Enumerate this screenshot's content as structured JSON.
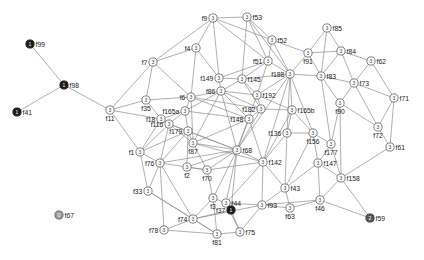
{
  "figure": {
    "type": "network-graph",
    "title": "",
    "background_color": "#ffffff",
    "edge_color": "#8c8c8c",
    "node_fill_default": "#ffffff",
    "node_stroke_default": "#6f6f6f",
    "label_color": "#1a1a1a"
  },
  "chart_data": {
    "type": "scatter",
    "title": "",
    "xlabel": "",
    "ylabel": "",
    "grid": false,
    "legend": "none",
    "node_state_legend": {
      "0": "gray node, value 0",
      "1": "black node, value 1",
      "2": "dark gray node, value 2",
      "3": "white node, value 3"
    },
    "nodes": [
      {
        "id": "f99",
        "label": "f99",
        "x": 30,
        "y": 44,
        "state": "1",
        "style": "dark",
        "lpos": "r"
      },
      {
        "id": "f98",
        "label": "f98",
        "x": 64,
        "y": 85,
        "state": "1",
        "style": "dark",
        "lpos": "r"
      },
      {
        "id": "f41",
        "label": "f41",
        "x": 17,
        "y": 112,
        "state": "1",
        "style": "dark",
        "lpos": "r"
      },
      {
        "id": "f67",
        "label": "f67",
        "x": 59,
        "y": 215,
        "state": "0",
        "style": "gray",
        "lpos": "r"
      },
      {
        "id": "f59",
        "label": "f59",
        "x": 370,
        "y": 218,
        "state": "2",
        "style": "mid",
        "lpos": "r"
      },
      {
        "id": "f11",
        "label": "f11",
        "x": 110,
        "y": 110,
        "state": "3",
        "style": "white",
        "lpos": "b"
      },
      {
        "id": "f35",
        "label": "f35",
        "x": 146,
        "y": 100,
        "state": "3",
        "style": "white",
        "lpos": "b"
      },
      {
        "id": "f7",
        "label": "f7",
        "x": 153,
        "y": 62,
        "state": "3",
        "style": "white",
        "lpos": "l"
      },
      {
        "id": "f4",
        "label": "f4",
        "x": 196,
        "y": 48,
        "state": "3",
        "style": "white",
        "lpos": "l"
      },
      {
        "id": "f18",
        "label": "f18",
        "x": 161,
        "y": 119,
        "state": "3",
        "style": "white",
        "lpos": "l"
      },
      {
        "id": "f6",
        "label": "f6",
        "x": 191,
        "y": 97,
        "state": "3",
        "style": "white",
        "lpos": "l"
      },
      {
        "id": "f165a",
        "label": "f165a",
        "x": 185,
        "y": 111,
        "state": "3",
        "style": "white",
        "lpos": "l"
      },
      {
        "id": "f86",
        "label": "f86",
        "x": 221,
        "y": 91,
        "state": "3",
        "style": "white",
        "lpos": "l"
      },
      {
        "id": "f149",
        "label": "f149",
        "x": 219,
        "y": 78,
        "state": "3",
        "style": "white",
        "lpos": "l"
      },
      {
        "id": "f9",
        "label": "f9",
        "x": 213,
        "y": 18,
        "state": "3",
        "style": "white",
        "lpos": "l"
      },
      {
        "id": "f53",
        "label": "f53",
        "x": 247,
        "y": 17,
        "state": "3",
        "style": "white",
        "lpos": "r"
      },
      {
        "id": "f52",
        "label": "f52",
        "x": 272,
        "y": 40,
        "state": "3",
        "style": "white",
        "lpos": "r"
      },
      {
        "id": "f51",
        "label": "f51",
        "x": 268,
        "y": 61,
        "state": "3",
        "style": "white",
        "lpos": "l"
      },
      {
        "id": "f145",
        "label": "f145",
        "x": 242,
        "y": 79,
        "state": "3",
        "style": "white",
        "lpos": "r"
      },
      {
        "id": "f192",
        "label": "f192",
        "x": 257,
        "y": 95,
        "state": "3",
        "style": "white",
        "lpos": "r"
      },
      {
        "id": "f182",
        "label": "f182",
        "x": 261,
        "y": 109,
        "state": "3",
        "style": "white",
        "lpos": "l"
      },
      {
        "id": "f148",
        "label": "f148",
        "x": 249,
        "y": 119,
        "state": "3",
        "style": "white",
        "lpos": "l"
      },
      {
        "id": "f188",
        "label": "f188",
        "x": 290,
        "y": 74,
        "state": "3",
        "style": "white",
        "lpos": "l"
      },
      {
        "id": "f91",
        "label": "f91",
        "x": 308,
        "y": 53,
        "state": "3",
        "style": "white",
        "lpos": "b"
      },
      {
        "id": "f85",
        "label": "f85",
        "x": 327,
        "y": 28,
        "state": "3",
        "style": "white",
        "lpos": "r"
      },
      {
        "id": "f84",
        "label": "f84",
        "x": 341,
        "y": 51,
        "state": "3",
        "style": "white",
        "lpos": "r"
      },
      {
        "id": "f83",
        "label": "f83",
        "x": 321,
        "y": 76,
        "state": "3",
        "style": "white",
        "lpos": "r"
      },
      {
        "id": "f62",
        "label": "f62",
        "x": 371,
        "y": 61,
        "state": "3",
        "style": "white",
        "lpos": "r"
      },
      {
        "id": "f73",
        "label": "f73",
        "x": 354,
        "y": 83,
        "state": "3",
        "style": "white",
        "lpos": "r"
      },
      {
        "id": "f71",
        "label": "f71",
        "x": 394,
        "y": 98,
        "state": "3",
        "style": "white",
        "lpos": "r"
      },
      {
        "id": "f90",
        "label": "f90",
        "x": 340,
        "y": 103,
        "state": "3",
        "style": "white",
        "lpos": "b"
      },
      {
        "id": "f72",
        "label": "f72",
        "x": 378,
        "y": 127,
        "state": "3",
        "style": "white",
        "lpos": "b"
      },
      {
        "id": "f61",
        "label": "f61",
        "x": 390,
        "y": 147,
        "state": "3",
        "style": "white",
        "lpos": "r"
      },
      {
        "id": "f165b",
        "label": "f165b",
        "x": 292,
        "y": 110,
        "state": "3",
        "style": "white",
        "lpos": "r"
      },
      {
        "id": "f136",
        "label": "f136",
        "x": 287,
        "y": 133,
        "state": "3",
        "style": "white",
        "lpos": "l"
      },
      {
        "id": "f156",
        "label": "f156",
        "x": 313,
        "y": 133,
        "state": "3",
        "style": "white",
        "lpos": "b"
      },
      {
        "id": "f177",
        "label": "f177",
        "x": 331,
        "y": 144,
        "state": "3",
        "style": "white",
        "lpos": "b"
      },
      {
        "id": "f147",
        "label": "f147",
        "x": 318,
        "y": 163,
        "state": "3",
        "style": "white",
        "lpos": "r"
      },
      {
        "id": "f158",
        "label": "f158",
        "x": 341,
        "y": 178,
        "state": "3",
        "style": "white",
        "lpos": "r"
      },
      {
        "id": "f46",
        "label": "f46",
        "x": 320,
        "y": 200,
        "state": "3",
        "style": "white",
        "lpos": "b"
      },
      {
        "id": "f43",
        "label": "f43",
        "x": 285,
        "y": 188,
        "state": "3",
        "style": "white",
        "lpos": "r"
      },
      {
        "id": "f63",
        "label": "f63",
        "x": 290,
        "y": 208,
        "state": "3",
        "style": "white",
        "lpos": "b"
      },
      {
        "id": "f93",
        "label": "f93",
        "x": 262,
        "y": 205,
        "state": "3",
        "style": "white",
        "lpos": "r"
      },
      {
        "id": "f75",
        "label": "f75",
        "x": 240,
        "y": 232,
        "state": "3",
        "style": "white",
        "lpos": "r"
      },
      {
        "id": "f44",
        "label": "f44",
        "x": 226,
        "y": 203,
        "state": "3",
        "style": "white",
        "lpos": "r"
      },
      {
        "id": "f37",
        "label": "f37",
        "x": 231,
        "y": 210,
        "state": "1",
        "style": "dark",
        "lpos": "l"
      },
      {
        "id": "f3",
        "label": "f3",
        "x": 213,
        "y": 198,
        "state": "3",
        "style": "white",
        "lpos": "b"
      },
      {
        "id": "f142",
        "label": "f142",
        "x": 263,
        "y": 162,
        "state": "3",
        "style": "white",
        "lpos": "r"
      },
      {
        "id": "f68",
        "label": "f68",
        "x": 237,
        "y": 150,
        "state": "3",
        "style": "white",
        "lpos": "r"
      },
      {
        "id": "f87",
        "label": "f87",
        "x": 193,
        "y": 143,
        "state": "3",
        "style": "white",
        "lpos": "b"
      },
      {
        "id": "f70",
        "label": "f70",
        "x": 207,
        "y": 170,
        "state": "3",
        "style": "white",
        "lpos": "b"
      },
      {
        "id": "f2",
        "label": "f2",
        "x": 187,
        "y": 167,
        "state": "3",
        "style": "white",
        "lpos": "b"
      },
      {
        "id": "f179",
        "label": "f179",
        "x": 188,
        "y": 131,
        "state": "3",
        "style": "white",
        "lpos": "l"
      },
      {
        "id": "f116",
        "label": "f116",
        "x": 169,
        "y": 124,
        "state": "3",
        "style": "white",
        "lpos": "l"
      },
      {
        "id": "f1",
        "label": "f1",
        "x": 140,
        "y": 152,
        "state": "3",
        "style": "white",
        "lpos": "l"
      },
      {
        "id": "f76",
        "label": "f76",
        "x": 160,
        "y": 163,
        "state": "3",
        "style": "white",
        "lpos": "l"
      },
      {
        "id": "f33",
        "label": "f33",
        "x": 148,
        "y": 191,
        "state": "3",
        "style": "white",
        "lpos": "l"
      },
      {
        "id": "f74",
        "label": "f74",
        "x": 193,
        "y": 219,
        "state": "3",
        "style": "white",
        "lpos": "l"
      },
      {
        "id": "f78",
        "label": "f78",
        "x": 164,
        "y": 230,
        "state": "3",
        "style": "white",
        "lpos": "l"
      },
      {
        "id": "f81",
        "label": "f81",
        "x": 217,
        "y": 234,
        "state": "3",
        "style": "white",
        "lpos": "b"
      }
    ],
    "edges": [
      [
        "f99",
        "f98"
      ],
      [
        "f41",
        "f98"
      ],
      [
        "f98",
        "f11"
      ],
      [
        "f11",
        "f35"
      ],
      [
        "f11",
        "f7"
      ],
      [
        "f11",
        "f1"
      ],
      [
        "f11",
        "f18"
      ],
      [
        "f7",
        "f4"
      ],
      [
        "f7",
        "f35"
      ],
      [
        "f7",
        "f6"
      ],
      [
        "f7",
        "f9"
      ],
      [
        "f4",
        "f6"
      ],
      [
        "f4",
        "f9"
      ],
      [
        "f4",
        "f149"
      ],
      [
        "f35",
        "f6"
      ],
      [
        "f35",
        "f18"
      ],
      [
        "f18",
        "f165a"
      ],
      [
        "f18",
        "f116"
      ],
      [
        "f18",
        "f1"
      ],
      [
        "f6",
        "f165a"
      ],
      [
        "f6",
        "f86"
      ],
      [
        "f6",
        "f148"
      ],
      [
        "f6",
        "f182"
      ],
      [
        "f6",
        "f87"
      ],
      [
        "f165a",
        "f86"
      ],
      [
        "f165a",
        "f148"
      ],
      [
        "f165a",
        "f179"
      ],
      [
        "f165a",
        "f116"
      ],
      [
        "f86",
        "f149"
      ],
      [
        "f86",
        "f145"
      ],
      [
        "f86",
        "f148"
      ],
      [
        "f86",
        "f182"
      ],
      [
        "f86",
        "f192"
      ],
      [
        "f86",
        "f68"
      ],
      [
        "f86",
        "f87"
      ],
      [
        "f149",
        "f145"
      ],
      [
        "f149",
        "f9"
      ],
      [
        "f149",
        "f51"
      ],
      [
        "f9",
        "f53"
      ],
      [
        "f9",
        "f51"
      ],
      [
        "f9",
        "f52"
      ],
      [
        "f53",
        "f52"
      ],
      [
        "f53",
        "f51"
      ],
      [
        "f53",
        "f145"
      ],
      [
        "f53",
        "f188"
      ],
      [
        "f52",
        "f51"
      ],
      [
        "f52",
        "f188"
      ],
      [
        "f52",
        "f91"
      ],
      [
        "f51",
        "f145"
      ],
      [
        "f51",
        "f188"
      ],
      [
        "f51",
        "f192"
      ],
      [
        "f145",
        "f192"
      ],
      [
        "f145",
        "f182"
      ],
      [
        "f145",
        "f188"
      ],
      [
        "f192",
        "f182"
      ],
      [
        "f192",
        "f188"
      ],
      [
        "f192",
        "f165b"
      ],
      [
        "f192",
        "f68"
      ],
      [
        "f182",
        "f148"
      ],
      [
        "f182",
        "f68"
      ],
      [
        "f182",
        "f165b"
      ],
      [
        "f148",
        "f68"
      ],
      [
        "f148",
        "f87"
      ],
      [
        "f148",
        "f142"
      ],
      [
        "f188",
        "f91"
      ],
      [
        "f188",
        "f83"
      ],
      [
        "f188",
        "f165b"
      ],
      [
        "f188",
        "f68"
      ],
      [
        "f188",
        "f142"
      ],
      [
        "f188",
        "f156"
      ],
      [
        "f188",
        "f136"
      ],
      [
        "f91",
        "f85"
      ],
      [
        "f91",
        "f83"
      ],
      [
        "f91",
        "f84"
      ],
      [
        "f85",
        "f84"
      ],
      [
        "f85",
        "f83"
      ],
      [
        "f84",
        "f83"
      ],
      [
        "f84",
        "f62"
      ],
      [
        "f84",
        "f73"
      ],
      [
        "f83",
        "f73"
      ],
      [
        "f83",
        "f90"
      ],
      [
        "f83",
        "f177"
      ],
      [
        "f62",
        "f73"
      ],
      [
        "f62",
        "f71"
      ],
      [
        "f73",
        "f90"
      ],
      [
        "f73",
        "f71"
      ],
      [
        "f73",
        "f72"
      ],
      [
        "f71",
        "f72"
      ],
      [
        "f71",
        "f61"
      ],
      [
        "f90",
        "f72"
      ],
      [
        "f90",
        "f177"
      ],
      [
        "f90",
        "f158"
      ],
      [
        "f72",
        "f61"
      ],
      [
        "f61",
        "f158"
      ],
      [
        "f165b",
        "f136"
      ],
      [
        "f165b",
        "f156"
      ],
      [
        "f165b",
        "f142"
      ],
      [
        "f136",
        "f142"
      ],
      [
        "f136",
        "f156"
      ],
      [
        "f136",
        "f43"
      ],
      [
        "f156",
        "f177"
      ],
      [
        "f156",
        "f147"
      ],
      [
        "f156",
        "f43"
      ],
      [
        "f177",
        "f147"
      ],
      [
        "f177",
        "f158"
      ],
      [
        "f147",
        "f158"
      ],
      [
        "f147",
        "f46"
      ],
      [
        "f147",
        "f43"
      ],
      [
        "f158",
        "f46"
      ],
      [
        "f158",
        "f59"
      ],
      [
        "f46",
        "f63"
      ],
      [
        "f46",
        "f59"
      ],
      [
        "f46",
        "f93"
      ],
      [
        "f43",
        "f63"
      ],
      [
        "f43",
        "f142"
      ],
      [
        "f43",
        "f93"
      ],
      [
        "f63",
        "f93"
      ],
      [
        "f93",
        "f44"
      ],
      [
        "f93",
        "f142"
      ],
      [
        "f93",
        "f75"
      ],
      [
        "f44",
        "f68"
      ],
      [
        "f44",
        "f3"
      ],
      [
        "f44",
        "f37"
      ],
      [
        "f44",
        "f142"
      ],
      [
        "f37",
        "f68"
      ],
      [
        "f37",
        "f74"
      ],
      [
        "f3",
        "f70"
      ],
      [
        "f3",
        "f68"
      ],
      [
        "f3",
        "f74"
      ],
      [
        "f3",
        "f81"
      ],
      [
        "f142",
        "f68"
      ],
      [
        "f142",
        "f70"
      ],
      [
        "f142",
        "f87"
      ],
      [
        "f68",
        "f70"
      ],
      [
        "f68",
        "f87"
      ],
      [
        "f68",
        "f2"
      ],
      [
        "f68",
        "f76"
      ],
      [
        "f68",
        "f179"
      ],
      [
        "f68",
        "f116"
      ],
      [
        "f87",
        "f179"
      ],
      [
        "f87",
        "f116"
      ],
      [
        "f87",
        "f70"
      ],
      [
        "f70",
        "f2"
      ],
      [
        "f2",
        "f76"
      ],
      [
        "f2",
        "f179"
      ],
      [
        "f179",
        "f116"
      ],
      [
        "f179",
        "f76"
      ],
      [
        "f116",
        "f76"
      ],
      [
        "f116",
        "f1"
      ],
      [
        "f1",
        "f76"
      ],
      [
        "f1",
        "f33"
      ],
      [
        "f76",
        "f33"
      ],
      [
        "f76",
        "f74"
      ],
      [
        "f76",
        "f78"
      ],
      [
        "f33",
        "f74"
      ],
      [
        "f74",
        "f78"
      ],
      [
        "f74",
        "f81"
      ],
      [
        "f74",
        "f93"
      ],
      [
        "f78",
        "f81"
      ],
      [
        "f81",
        "f75"
      ],
      [
        "f75",
        "f37"
      ],
      [
        "f75",
        "f44"
      ],
      [
        "f1",
        "f179"
      ],
      [
        "f33",
        "f81"
      ],
      [
        "f2",
        "f70"
      ]
    ]
  }
}
